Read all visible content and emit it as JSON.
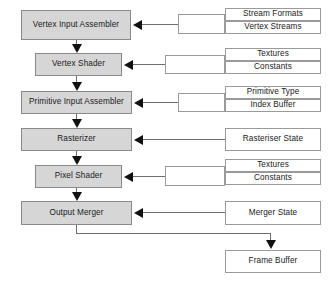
{
  "diagram": {
    "type": "flowchart",
    "colors": {
      "stage_fill": "#d6d6d6",
      "stage_border": "#8a8a8a",
      "resource_fill": "#ffffff",
      "resource_border": "#9a9a9a",
      "arrow": "#111111",
      "line": "#6e6e6e",
      "background": "#ffffff"
    },
    "stages": [
      {
        "id": "vertex-input-assembler",
        "label": "Vertex Input Assembler"
      },
      {
        "id": "vertex-shader",
        "label": "Vertex Shader"
      },
      {
        "id": "primitive-input-assembler",
        "label": "Primitive Input Assembler"
      },
      {
        "id": "rasterizer",
        "label": "Rasterizer"
      },
      {
        "id": "pixel-shader",
        "label": "Pixel Shader"
      },
      {
        "id": "output-merger",
        "label": "Output Merger"
      }
    ],
    "resources": [
      {
        "id": "stream-formats",
        "label": "Stream Formats"
      },
      {
        "id": "vertex-streams",
        "label": "Vertex Streams"
      },
      {
        "id": "textures-vs",
        "label": "Textures"
      },
      {
        "id": "constants-vs",
        "label": "Constants"
      },
      {
        "id": "primitive-type",
        "label": "Primitive Type"
      },
      {
        "id": "index-buffer",
        "label": "Index Buffer"
      },
      {
        "id": "rasteriser-state",
        "label": "Rasteriser State"
      },
      {
        "id": "textures-ps",
        "label": "Textures"
      },
      {
        "id": "constants-ps",
        "label": "Constants"
      },
      {
        "id": "merger-state",
        "label": "Merger State"
      },
      {
        "id": "frame-buffer",
        "label": "Frame Buffer"
      }
    ],
    "connections": [
      {
        "from": "vertex-input-assembler",
        "to": "vertex-shader",
        "kind": "flow-down"
      },
      {
        "from": "vertex-shader",
        "to": "primitive-input-assembler",
        "kind": "flow-down"
      },
      {
        "from": "primitive-input-assembler",
        "to": "rasterizer",
        "kind": "flow-down"
      },
      {
        "from": "rasterizer",
        "to": "pixel-shader",
        "kind": "flow-down"
      },
      {
        "from": "pixel-shader",
        "to": "output-merger",
        "kind": "flow-down"
      },
      {
        "from": "stream-formats,vertex-streams",
        "to": "vertex-input-assembler",
        "kind": "feed-left"
      },
      {
        "from": "textures-vs,constants-vs",
        "to": "vertex-shader",
        "kind": "feed-left"
      },
      {
        "from": "primitive-type,index-buffer",
        "to": "primitive-input-assembler",
        "kind": "feed-left"
      },
      {
        "from": "rasteriser-state",
        "to": "rasterizer",
        "kind": "feed-left"
      },
      {
        "from": "textures-ps,constants-ps",
        "to": "pixel-shader",
        "kind": "feed-left"
      },
      {
        "from": "merger-state",
        "to": "output-merger",
        "kind": "feed-left"
      },
      {
        "from": "output-merger",
        "to": "frame-buffer",
        "kind": "output-elbow"
      }
    ]
  }
}
